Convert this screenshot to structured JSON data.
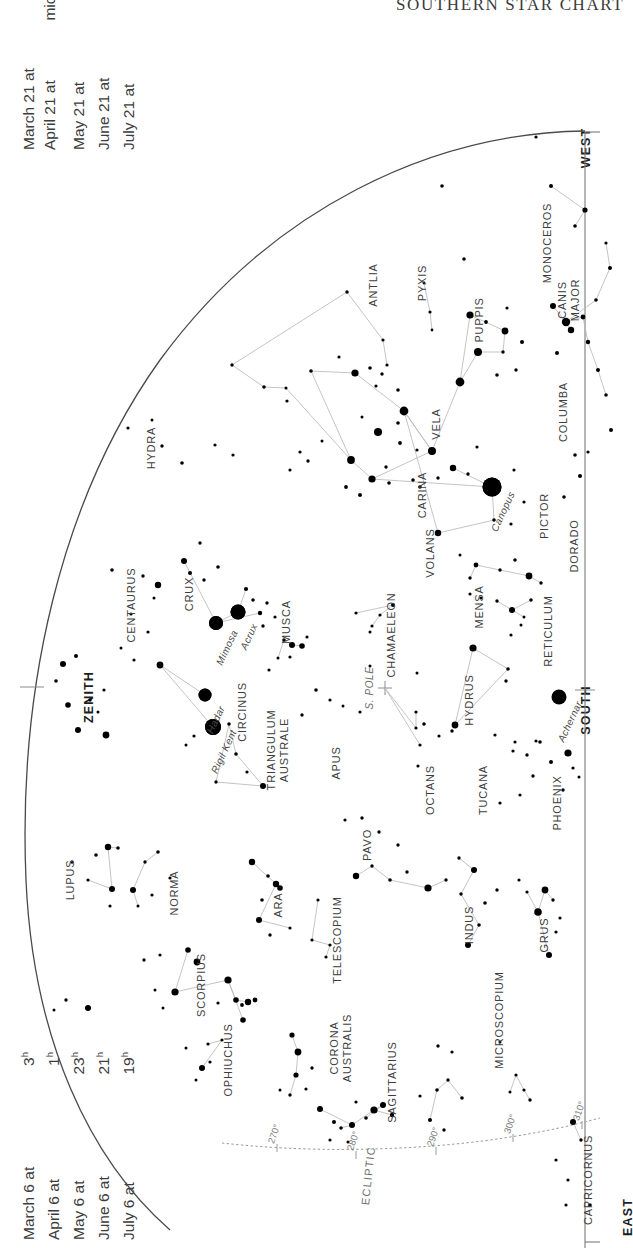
{
  "chart": {
    "title": "SOUTHERN STAR CHART",
    "type": "star-chart",
    "hemisphere": "southern",
    "orientation_note": "chart rotated 90 degrees; labels read bottom-to-top"
  },
  "cardinals": {
    "west": "WEST",
    "south": "SOUTH",
    "east": "EAST",
    "zenith": "ZENITH",
    "south_pole": "S. POLE"
  },
  "legend_top": {
    "rows": [
      {
        "date": "March 21 at",
        "time": "2",
        "sup": "h"
      },
      {
        "date": "April 21 at",
        "time": "midnight",
        "sup": ""
      },
      {
        "date": "May 21 at",
        "time": "22",
        "sup": "h"
      },
      {
        "date": "June 21 at",
        "time": "20",
        "sup": "h"
      },
      {
        "date": "July 21 at",
        "time": "18",
        "sup": "h"
      }
    ]
  },
  "legend_bottom": {
    "rows": [
      {
        "date": "March 6 at",
        "time": "3",
        "sup": "h"
      },
      {
        "date": "April 6 at",
        "time": "1",
        "sup": "h"
      },
      {
        "date": "May 6 at",
        "time": "23",
        "sup": "h"
      },
      {
        "date": "June 6 at",
        "time": "21",
        "sup": "h"
      },
      {
        "date": "July 6 at",
        "time": "19",
        "sup": "h"
      }
    ]
  },
  "ecliptic": {
    "label": "ECLIPTIC",
    "degree_marks": [
      "270°",
      "280°",
      "290°",
      "300°",
      "310°"
    ]
  },
  "named_stars": [
    {
      "name": "Canopus",
      "x": 492,
      "y": 487,
      "r": 9.5
    },
    {
      "name": "Acrux",
      "x": 238,
      "y": 612,
      "r": 7.5
    },
    {
      "name": "Mimosa",
      "x": 216,
      "y": 623,
      "r": 7.0
    },
    {
      "name": "Hadar",
      "x": 205,
      "y": 695,
      "r": 6.5
    },
    {
      "name": "Rigil Kent",
      "x": 213,
      "y": 727,
      "r": 8.0
    },
    {
      "name": "Achernar",
      "x": 559,
      "y": 697,
      "r": 7.5
    }
  ],
  "constellations": [
    {
      "name": "MONOCEROS",
      "x": 551,
      "y": 243
    },
    {
      "name": "CANIS\nMAJOR",
      "x": 566,
      "y": 300
    },
    {
      "name": "COLUMBA",
      "x": 567,
      "y": 412
    },
    {
      "name": "PUPPIS",
      "x": 483,
      "y": 320
    },
    {
      "name": "PYXIS",
      "x": 426,
      "y": 283
    },
    {
      "name": "ANTLIA",
      "x": 377,
      "y": 285
    },
    {
      "name": "VELA",
      "x": 440,
      "y": 424
    },
    {
      "name": "CARINA",
      "x": 426,
      "y": 495
    },
    {
      "name": "HYDRA",
      "x": 155,
      "y": 448
    },
    {
      "name": "CENTAURUS",
      "x": 135,
      "y": 605
    },
    {
      "name": "CRUX",
      "x": 193,
      "y": 594
    },
    {
      "name": "MUSCA",
      "x": 290,
      "y": 622
    },
    {
      "name": "CIRCINUS",
      "x": 246,
      "y": 712
    },
    {
      "name": "TRIANGULUM\nAUSTRALE",
      "x": 275,
      "y": 750
    },
    {
      "name": "APUS",
      "x": 340,
      "y": 763
    },
    {
      "name": "CHAMAELEON",
      "x": 395,
      "y": 635
    },
    {
      "name": "VOLANS",
      "x": 434,
      "y": 553
    },
    {
      "name": "MENSA",
      "x": 483,
      "y": 607
    },
    {
      "name": "PICTOR",
      "x": 548,
      "y": 516
    },
    {
      "name": "DORADO",
      "x": 578,
      "y": 546
    },
    {
      "name": "RETICULUM",
      "x": 552,
      "y": 631
    },
    {
      "name": "HYDRUS",
      "x": 473,
      "y": 700
    },
    {
      "name": "OCTANS",
      "x": 434,
      "y": 790
    },
    {
      "name": "TUCANA",
      "x": 487,
      "y": 790
    },
    {
      "name": "PHOENIX",
      "x": 561,
      "y": 803
    },
    {
      "name": "PAVO",
      "x": 371,
      "y": 845
    },
    {
      "name": "LUPUS",
      "x": 74,
      "y": 880
    },
    {
      "name": "NORMA",
      "x": 178,
      "y": 893
    },
    {
      "name": "ARA",
      "x": 282,
      "y": 905
    },
    {
      "name": "TELESCOPIUM",
      "x": 341,
      "y": 940
    },
    {
      "name": "INDUS",
      "x": 473,
      "y": 925
    },
    {
      "name": "GRUS",
      "x": 548,
      "y": 935
    },
    {
      "name": "SCORPIUS",
      "x": 205,
      "y": 985
    },
    {
      "name": "OPHIUCHUS",
      "x": 232,
      "y": 1060
    },
    {
      "name": "CORONA\nAUSTRALIS",
      "x": 338,
      "y": 1048
    },
    {
      "name": "SAGITTARIUS",
      "x": 396,
      "y": 1082
    },
    {
      "name": "MICROSCOPIUM",
      "x": 503,
      "y": 1020
    },
    {
      "name": "CAPRICORNUS",
      "x": 592,
      "y": 1180
    }
  ],
  "colors": {
    "star": "#000000",
    "line": "#b9b9b9",
    "horizon": "#4a4a4a",
    "ecliptic": "#9a9a9a",
    "label": "#3d3d3d",
    "background": "#ffffff"
  },
  "stars": [
    [
      551,
      186,
      2.0
    ],
    [
      536,
      137,
      1.6
    ],
    [
      585,
      210,
      2.6
    ],
    [
      575,
      226,
      1.8
    ],
    [
      606,
      243,
      1.6
    ],
    [
      610,
      268,
      2.0
    ],
    [
      553,
      306,
      3.0
    ],
    [
      566,
      322,
      4.2
    ],
    [
      571,
      330,
      3.2
    ],
    [
      583,
      317,
      2.4
    ],
    [
      588,
      342,
      2.2
    ],
    [
      596,
      300,
      1.8
    ],
    [
      557,
      353,
      2.0
    ],
    [
      598,
      370,
      2.0
    ],
    [
      606,
      395,
      1.8
    ],
    [
      611,
      430,
      2.0
    ],
    [
      588,
      452,
      1.6
    ],
    [
      575,
      455,
      1.8
    ],
    [
      580,
      476,
      2.0
    ],
    [
      564,
      497,
      1.8
    ],
    [
      442,
      186,
      1.8
    ],
    [
      464,
      259,
      1.8
    ],
    [
      507,
      308,
      1.6
    ],
    [
      470,
      315,
      3.6
    ],
    [
      486,
      322,
      1.9
    ],
    [
      505,
      331,
      3.4
    ],
    [
      503,
      352,
      1.7
    ],
    [
      522,
      342,
      2.0
    ],
    [
      478,
      352,
      4.0
    ],
    [
      497,
      375,
      1.8
    ],
    [
      516,
      370,
      1.7
    ],
    [
      460,
      382,
      4.4
    ],
    [
      424,
      283,
      1.4
    ],
    [
      430,
      312,
      1.6
    ],
    [
      432,
      330,
      1.4
    ],
    [
      347,
      292,
      1.7
    ],
    [
      383,
      340,
      1.6
    ],
    [
      387,
      365,
      1.6
    ],
    [
      339,
      357,
      1.6
    ],
    [
      232,
      365,
      1.7
    ],
    [
      264,
      387,
      1.8
    ],
    [
      287,
      401,
      1.6
    ],
    [
      286,
      388,
      1.5
    ],
    [
      311,
      371,
      1.8
    ],
    [
      355,
      373,
      3.6
    ],
    [
      370,
      368,
      1.8
    ],
    [
      382,
      374,
      1.7
    ],
    [
      376,
      386,
      1.6
    ],
    [
      398,
      390,
      1.8
    ],
    [
      404,
      411,
      4.4
    ],
    [
      362,
      417,
      1.5
    ],
    [
      398,
      423,
      1.8
    ],
    [
      378,
      432,
      4.0
    ],
    [
      400,
      443,
      1.9
    ],
    [
      351,
      460,
      3.9
    ],
    [
      417,
      450,
      1.6
    ],
    [
      432,
      451,
      4.0
    ],
    [
      386,
      467,
      1.7
    ],
    [
      372,
      479,
      3.6
    ],
    [
      389,
      483,
      1.8
    ],
    [
      413,
      480,
      1.8
    ],
    [
      438,
      478,
      1.7
    ],
    [
      322,
      441,
      1.5
    ],
    [
      300,
      452,
      1.6
    ],
    [
      308,
      461,
      1.7
    ],
    [
      290,
      470,
      1.6
    ],
    [
      346,
      487,
      1.9
    ],
    [
      360,
      495,
      2.0
    ],
    [
      420,
      487,
      1.8
    ],
    [
      492,
      487,
      9.5
    ],
    [
      468,
      474,
      1.7
    ],
    [
      453,
      468,
      3.2
    ],
    [
      477,
      447,
      1.6
    ],
    [
      514,
      470,
      1.6
    ],
    [
      524,
      502,
      1.6
    ],
    [
      511,
      524,
      1.6
    ],
    [
      494,
      520,
      1.8
    ],
    [
      438,
      533,
      3.2
    ],
    [
      460,
      555,
      1.5
    ],
    [
      476,
      565,
      2.4
    ],
    [
      470,
      578,
      1.7
    ],
    [
      500,
      570,
      1.7
    ],
    [
      515,
      560,
      1.8
    ],
    [
      529,
      576,
      3.4
    ],
    [
      541,
      583,
      1.7
    ],
    [
      470,
      594,
      1.6
    ],
    [
      481,
      598,
      1.6
    ],
    [
      497,
      601,
      1.7
    ],
    [
      512,
      610,
      3.0
    ],
    [
      524,
      617,
      1.5
    ],
    [
      521,
      625,
      1.5
    ],
    [
      531,
      600,
      1.8
    ],
    [
      511,
      635,
      1.6
    ],
    [
      128,
      428,
      1.6
    ],
    [
      152,
      420,
      1.5
    ],
    [
      162,
      446,
      1.7
    ],
    [
      182,
      463,
      1.8
    ],
    [
      215,
      445,
      1.6
    ],
    [
      233,
      455,
      1.6
    ],
    [
      112,
      570,
      1.8
    ],
    [
      143,
      576,
      1.7
    ],
    [
      158,
      585,
      3.2
    ],
    [
      154,
      598,
      1.5
    ],
    [
      131,
      614,
      1.6
    ],
    [
      148,
      632,
      1.6
    ],
    [
      184,
      561,
      3.0
    ],
    [
      190,
      573,
      2.0
    ],
    [
      204,
      580,
      1.7
    ],
    [
      218,
      567,
      1.8
    ],
    [
      200,
      543,
      1.7
    ],
    [
      216,
      623,
      7.0
    ],
    [
      238,
      612,
      7.5
    ],
    [
      253,
      600,
      1.8
    ],
    [
      260,
      613,
      2.2
    ],
    [
      267,
      603,
      1.7
    ],
    [
      246,
      589,
      2.1
    ],
    [
      263,
      626,
      1.7
    ],
    [
      275,
      617,
      1.6
    ],
    [
      284,
      640,
      1.8
    ],
    [
      292,
      645,
      3.0
    ],
    [
      302,
      646,
      2.8
    ],
    [
      307,
      637,
      1.6
    ],
    [
      290,
      657,
      1.6
    ],
    [
      278,
      658,
      1.5
    ],
    [
      269,
      670,
      1.6
    ],
    [
      160,
      665,
      3.4
    ],
    [
      205,
      695,
      6.5
    ],
    [
      213,
      727,
      8.0
    ],
    [
      194,
      736,
      1.6
    ],
    [
      186,
      745,
      1.5
    ],
    [
      134,
      660,
      1.6
    ],
    [
      121,
      648,
      1.5
    ],
    [
      104,
      690,
      1.6
    ],
    [
      90,
      700,
      1.7
    ],
    [
      98,
      712,
      1.5
    ],
    [
      68,
      705,
      2.8
    ],
    [
      78,
      730,
      3.0
    ],
    [
      106,
      735,
      3.4
    ],
    [
      63,
      664,
      3.0
    ],
    [
      56,
      681,
      1.8
    ],
    [
      76,
      656,
      2.0
    ],
    [
      229,
      724,
      1.8
    ],
    [
      236,
      754,
      1.8
    ],
    [
      247,
      772,
      1.6
    ],
    [
      263,
      786,
      3.0
    ],
    [
      216,
      782,
      1.7
    ],
    [
      302,
      715,
      1.7
    ],
    [
      316,
      690,
      1.8
    ],
    [
      330,
      700,
      1.6
    ],
    [
      343,
      706,
      1.5
    ],
    [
      360,
      712,
      1.6
    ],
    [
      393,
      605,
      2.0
    ],
    [
      380,
      615,
      1.6
    ],
    [
      372,
      626,
      1.6
    ],
    [
      356,
      613,
      1.6
    ],
    [
      370,
      632,
      1.5
    ],
    [
      370,
      666,
      1.5
    ],
    [
      417,
      673,
      1.5
    ],
    [
      416,
      712,
      1.6
    ],
    [
      416,
      728,
      1.6
    ],
    [
      420,
      745,
      1.6
    ],
    [
      418,
      766,
      1.6
    ],
    [
      424,
      724,
      1.8
    ],
    [
      439,
      736,
      1.6
    ],
    [
      452,
      731,
      1.7
    ],
    [
      473,
      648,
      3.6
    ],
    [
      508,
      669,
      1.8
    ],
    [
      506,
      681,
      1.7
    ],
    [
      455,
      725,
      3.4
    ],
    [
      495,
      735,
      1.6
    ],
    [
      515,
      742,
      1.6
    ],
    [
      513,
      751,
      1.6
    ],
    [
      527,
      755,
      1.7
    ],
    [
      536,
      741,
      1.6
    ],
    [
      533,
      776,
      1.7
    ],
    [
      520,
      795,
      1.6
    ],
    [
      500,
      803,
      1.6
    ],
    [
      540,
      742,
      1.8
    ],
    [
      551,
      762,
      2.0
    ],
    [
      568,
      753,
      3.6
    ],
    [
      573,
      768,
      1.6
    ],
    [
      579,
      777,
      1.5
    ],
    [
      563,
      790,
      1.7
    ],
    [
      345,
      820,
      1.6
    ],
    [
      362,
      818,
      1.7
    ],
    [
      379,
      832,
      1.7
    ],
    [
      398,
      845,
      1.7
    ],
    [
      372,
      866,
      1.7
    ],
    [
      356,
      876,
      3.2
    ],
    [
      390,
      880,
      1.8
    ],
    [
      407,
      872,
      1.7
    ],
    [
      428,
      888,
      3.6
    ],
    [
      446,
      880,
      1.7
    ],
    [
      459,
      858,
      1.7
    ],
    [
      474,
      870,
      3.0
    ],
    [
      461,
      894,
      1.7
    ],
    [
      485,
      903,
      1.8
    ],
    [
      497,
      890,
      1.7
    ],
    [
      479,
      925,
      1.8
    ],
    [
      468,
      945,
      3.0
    ],
    [
      519,
      880,
      1.6
    ],
    [
      527,
      892,
      1.6
    ],
    [
      545,
      890,
      3.4
    ],
    [
      538,
      912,
      3.8
    ],
    [
      553,
      900,
      1.7
    ],
    [
      560,
      918,
      1.6
    ],
    [
      556,
      932,
      1.6
    ],
    [
      549,
      955,
      3.0
    ],
    [
      72,
      862,
      1.7
    ],
    [
      96,
      855,
      1.8
    ],
    [
      108,
      847,
      3.2
    ],
    [
      118,
      848,
      1.8
    ],
    [
      88,
      880,
      1.6
    ],
    [
      112,
      889,
      3.0
    ],
    [
      110,
      906,
      1.6
    ],
    [
      145,
      862,
      1.7
    ],
    [
      158,
      852,
      1.8
    ],
    [
      170,
      878,
      1.6
    ],
    [
      152,
      895,
      1.6
    ],
    [
      133,
      890,
      3.0
    ],
    [
      138,
      906,
      1.5
    ],
    [
      252,
      862,
      3.2
    ],
    [
      268,
      876,
      1.8
    ],
    [
      276,
      884,
      3.2
    ],
    [
      280,
      888,
      2.8
    ],
    [
      262,
      900,
      1.8
    ],
    [
      259,
      920,
      3.0
    ],
    [
      270,
      935,
      1.7
    ],
    [
      290,
      928,
      1.6
    ],
    [
      318,
      900,
      1.6
    ],
    [
      312,
      940,
      1.6
    ],
    [
      330,
      945,
      1.6
    ],
    [
      326,
      957,
      1.6
    ],
    [
      144,
      960,
      1.7
    ],
    [
      160,
      955,
      1.6
    ],
    [
      188,
      950,
      2.8
    ],
    [
      197,
      962,
      3.4
    ],
    [
      175,
      992,
      3.6
    ],
    [
      155,
      990,
      1.5
    ],
    [
      163,
      1008,
      1.5
    ],
    [
      228,
      980,
      3.6
    ],
    [
      236,
      1000,
      2.8
    ],
    [
      242,
      1005,
      1.9
    ],
    [
      248,
      1002,
      3.2
    ],
    [
      255,
      1000,
      2.4
    ],
    [
      243,
      1020,
      2.8
    ],
    [
      218,
      1003,
      1.6
    ],
    [
      222,
      1040,
      1.6
    ],
    [
      210,
      1062,
      1.6
    ],
    [
      202,
      1068,
      3.0
    ],
    [
      196,
      1080,
      1.5
    ],
    [
      186,
      1048,
      1.5
    ],
    [
      208,
      1044,
      1.6
    ],
    [
      292,
      1035,
      2.6
    ],
    [
      298,
      1052,
      3.4
    ],
    [
      296,
      1075,
      2.6
    ],
    [
      290,
      1095,
      1.7
    ],
    [
      312,
      1068,
      1.7
    ],
    [
      306,
      1089,
      1.6
    ],
    [
      280,
      1090,
      1.5
    ],
    [
      320,
      1109,
      3.0
    ],
    [
      334,
      1122,
      2.0
    ],
    [
      341,
      1128,
      1.8
    ],
    [
      352,
      1125,
      3.0
    ],
    [
      366,
      1118,
      1.8
    ],
    [
      374,
      1110,
      3.6
    ],
    [
      383,
      1105,
      3.0
    ],
    [
      392,
      1115,
      2.2
    ],
    [
      356,
      1102,
      1.6
    ],
    [
      330,
      1140,
      1.6
    ],
    [
      348,
      1142,
      1.5
    ],
    [
      420,
      1096,
      1.6
    ],
    [
      437,
      1090,
      1.8
    ],
    [
      448,
      1080,
      1.7
    ],
    [
      462,
      1098,
      1.8
    ],
    [
      430,
      1120,
      2.0
    ],
    [
      444,
      1130,
      1.7
    ],
    [
      500,
      1042,
      1.5
    ],
    [
      516,
      1075,
      1.6
    ],
    [
      524,
      1090,
      1.6
    ],
    [
      510,
      1092,
      1.5
    ],
    [
      530,
      1100,
      1.7
    ],
    [
      573,
      1122,
      3.0
    ],
    [
      581,
      1140,
      1.7
    ],
    [
      556,
      1160,
      1.6
    ],
    [
      568,
      1180,
      1.6
    ],
    [
      590,
      1205,
      1.8
    ],
    [
      566,
      1205,
      1.6
    ],
    [
      66,
      1000,
      1.7
    ],
    [
      54,
      1010,
      1.5
    ],
    [
      88,
      1008,
      3.0
    ],
    [
      438,
      1046,
      1.7
    ],
    [
      452,
      1052,
      1.6
    ]
  ]
}
